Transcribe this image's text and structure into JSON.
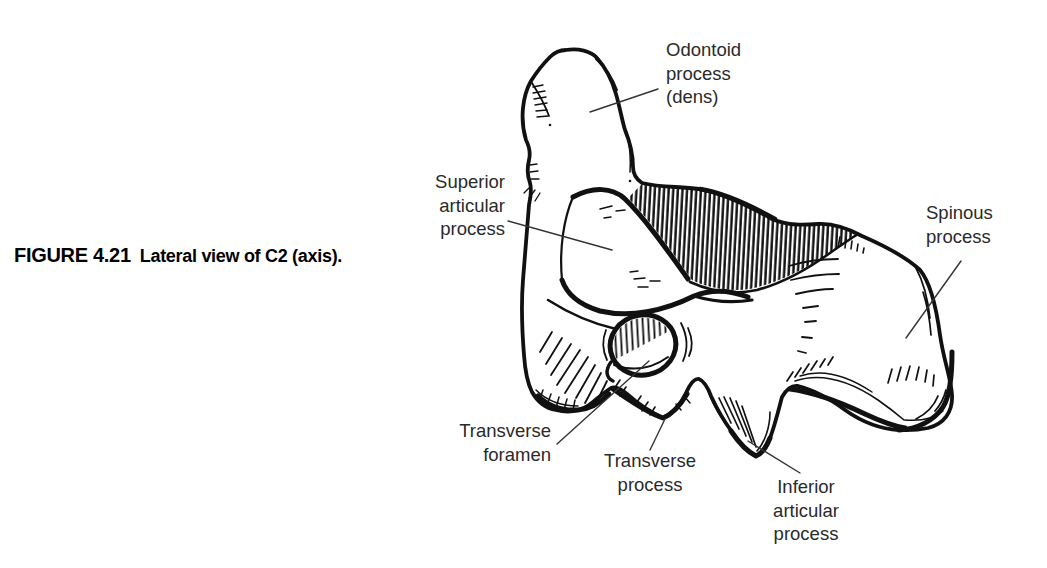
{
  "figure": {
    "number": "FIGURE 4.21",
    "caption": "Lateral view of C2 (axis)."
  },
  "labels": {
    "odontoid": {
      "text": "Odontoid\nprocess\n(dens)"
    },
    "superior_articular": {
      "text": "Superior\narticular\nprocess"
    },
    "spinous": {
      "text": "Spinous\nprocess"
    },
    "transverse_foramen": {
      "text": "Transverse\nforamen"
    },
    "transverse_process": {
      "text": "Transverse\nprocess"
    },
    "inferior_articular": {
      "text": "Inferior\narticular\nprocess"
    }
  },
  "illustration": {
    "subject": "C2 vertebra (axis), lateral view line drawing"
  },
  "colors": {
    "ink": "#111111",
    "label_text": "#2a2a2a",
    "leader_line": "#333333",
    "background": "#ffffff"
  }
}
